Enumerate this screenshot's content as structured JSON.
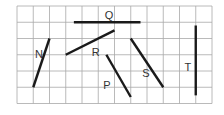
{
  "diagram": {
    "grid": {
      "columns": 12,
      "rows": 6,
      "origin_px": [
        17,
        6
      ],
      "cell_px": 16.25,
      "line_color": "#a8a8a8"
    },
    "segment_color": "#1a1a1a",
    "segments": [
      {
        "label": "Q",
        "from": [
          3.5,
          1
        ],
        "to": [
          7.6,
          1
        ],
        "label_pos": [
          5.4,
          0.55
        ]
      },
      {
        "label": "R",
        "from": [
          3,
          3
        ],
        "to": [
          6,
          1.5
        ],
        "label_pos": [
          4.6,
          2.8
        ]
      },
      {
        "label": "N",
        "from": [
          1,
          5
        ],
        "to": [
          2,
          2
        ],
        "label_pos": [
          1.1,
          2.95
        ]
      },
      {
        "label": "P",
        "from": [
          5.5,
          3
        ],
        "to": [
          7,
          5.6
        ],
        "label_pos": [
          5.3,
          4.85
        ]
      },
      {
        "label": "S",
        "from": [
          7,
          2
        ],
        "to": [
          9,
          5
        ],
        "label_pos": [
          7.7,
          4.1
        ]
      },
      {
        "label": "T",
        "from": [
          11,
          1.2
        ],
        "to": [
          11,
          5.5
        ],
        "label_pos": [
          10.3,
          3.75
        ]
      }
    ]
  }
}
